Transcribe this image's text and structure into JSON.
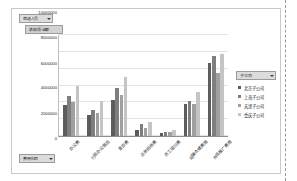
{
  "window": {
    "page_break_label": "page-break-guide"
  },
  "field_buttons": {
    "report_filter": "筛选人员",
    "value_field": "求和项:金额",
    "axis_field": "费用科目",
    "legend_field": "子公司"
  },
  "legend": {
    "title": "子公司",
    "items": [
      {
        "label": "北京子公司",
        "color": "#5c5c5c"
      },
      {
        "label": "上海子公司",
        "color": "#7e7e7e"
      },
      {
        "label": "天津子公司",
        "color": "#a0a0a0"
      },
      {
        "label": "重庆子公司",
        "color": "#c4c4c4"
      }
    ]
  },
  "chart_data": {
    "type": "bar",
    "title": "",
    "xlabel": "",
    "ylabel": "",
    "ylim": [
      0,
      12000000
    ],
    "grid": true,
    "legend_position": "right",
    "yticks": [
      "0",
      "2000000",
      "4000000",
      "6000000",
      "8000000",
      "10000000",
      "12000000"
    ],
    "categories": [
      "办公费",
      "行政办公用品",
      "差旅费",
      "业务招待费",
      "员工培训费",
      "运输仓储费用",
      "市场推广费用"
    ],
    "series": [
      {
        "name": "北京子公司",
        "values": [
          3700000,
          2500000,
          4300000,
          700000,
          400000,
          3850000,
          8650000
        ]
      },
      {
        "name": "上海子公司",
        "values": [
          4750000,
          3150000,
          5700000,
          1450000,
          450000,
          4200000,
          9500000
        ]
      },
      {
        "name": "天津子公司",
        "values": [
          4050000,
          2700000,
          4850000,
          900000,
          500000,
          3800000,
          7500000
        ]
      },
      {
        "name": "重庆子公司",
        "values": [
          6000000,
          4150000,
          7050000,
          1700000,
          700000,
          5250000,
          9800000
        ]
      }
    ]
  }
}
